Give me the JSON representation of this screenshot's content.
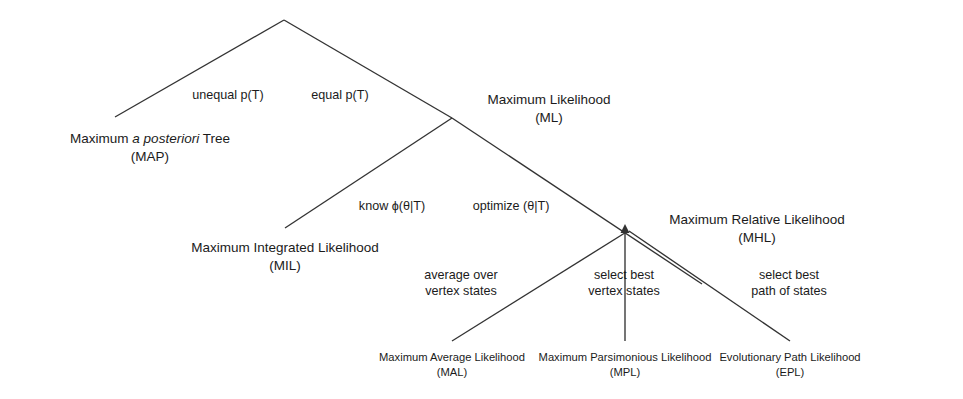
{
  "diagram": {
    "type": "hierarchy-tree",
    "background_color": "#ffffff",
    "line_color": "#333333",
    "text_color": "#1b1b1b",
    "nodes": [
      {
        "id": "root",
        "title": "",
        "abbr": "",
        "x": 284,
        "y": 20
      },
      {
        "id": "map",
        "title_pre": "Maximum ",
        "title_italic": "a posteriori",
        "title_post": " Tree",
        "title": "Maximum a posteriori Tree",
        "abbr": "(MAP)",
        "x": 150,
        "y": 138
      },
      {
        "id": "ml",
        "title": "Maximum Likelihood",
        "abbr": "(ML)",
        "x": 549,
        "y": 100
      },
      {
        "id": "mil",
        "title": "Maximum Integrated Likelihood",
        "abbr": "(MIL)",
        "x": 285,
        "y": 248
      },
      {
        "id": "mhl",
        "title": "Maximum Relative Likelihood",
        "abbr": "(MHL)",
        "x": 757,
        "y": 220
      },
      {
        "id": "mal",
        "title": "Maximum Average Likelihood",
        "abbr": "(MAL)",
        "x": 452,
        "y": 358
      },
      {
        "id": "mpl",
        "title": "Maximum Parsimonious Likelihood",
        "abbr": "(MPL)",
        "x": 625,
        "y": 358
      },
      {
        "id": "epl",
        "title": "Evolutionary Path Likelihood",
        "abbr": "(EPL)",
        "x": 790,
        "y": 358
      }
    ],
    "edge_labels": [
      {
        "id": "unequal-pt",
        "line1": "unequal p(T)",
        "line2": "",
        "x": 228,
        "y": 94
      },
      {
        "id": "equal-pt",
        "line1": "equal p(T)",
        "line2": "",
        "x": 340,
        "y": 94
      },
      {
        "id": "know-phi",
        "line1": "know ϕ(θ|T)",
        "line2": "",
        "x": 392,
        "y": 205
      },
      {
        "id": "optimize-theta",
        "line1": "optimize (θ|T)",
        "line2": "",
        "x": 511,
        "y": 205
      },
      {
        "id": "average-over-vertex-states",
        "line1": "average over",
        "line2": "vertex states",
        "x": 461,
        "y": 275
      },
      {
        "id": "select-best-vertex-states",
        "line1": "select best",
        "line2": "vertex states",
        "x": 624,
        "y": 275
      },
      {
        "id": "select-best-path-of-states",
        "line1": "select best",
        "line2": "path of states",
        "x": 789,
        "y": 275
      }
    ],
    "edges": [
      {
        "id": "root-to-map",
        "x1": 284,
        "y1": 20,
        "x2": 115,
        "y2": 117
      },
      {
        "id": "root-to-ml",
        "x1": 284,
        "y1": 20,
        "x2": 452,
        "y2": 118
      },
      {
        "id": "ml-to-mil",
        "x1": 452,
        "y1": 118,
        "x2": 285,
        "y2": 228
      },
      {
        "id": "ml-to-mhl",
        "x1": 452,
        "y1": 118,
        "x2": 700,
        "y2": 282
      },
      {
        "id": "mal-to-mhl",
        "x1": 452,
        "y1": 341,
        "x2": 625,
        "y2": 228
      },
      {
        "id": "mpl-to-mhl",
        "x1": 625,
        "y1": 341,
        "x2": 625,
        "y2": 228
      },
      {
        "id": "epl-to-mhl",
        "x1": 790,
        "y1": 341,
        "x2": 625,
        "y2": 228
      }
    ]
  }
}
